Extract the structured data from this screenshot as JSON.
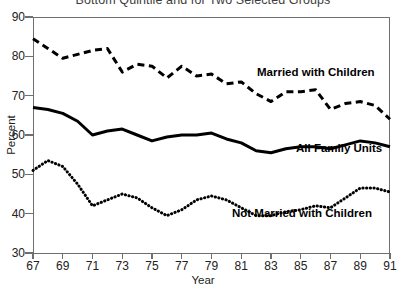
{
  "chart_data": {
    "type": "line",
    "title": "Bottom Quintile and for Two Selected Groups",
    "xlabel": "Year",
    "ylabel": "Percent",
    "xlim": [
      67,
      91
    ],
    "ylim": [
      30,
      90
    ],
    "yticks": [
      30,
      40,
      50,
      60,
      70,
      80,
      90
    ],
    "xticks": [
      67,
      69,
      71,
      73,
      75,
      77,
      79,
      81,
      83,
      85,
      87,
      89,
      91
    ],
    "grid": false,
    "legend_position": "inline-annotations",
    "x": [
      67,
      68,
      69,
      70,
      71,
      72,
      73,
      74,
      75,
      76,
      77,
      78,
      79,
      80,
      81,
      82,
      83,
      84,
      85,
      86,
      87,
      88,
      89,
      90,
      91
    ],
    "series": [
      {
        "name": "Married with Children",
        "style": "dashed",
        "color": "#000000",
        "values": [
          84.5,
          82.0,
          79.5,
          80.5,
          81.5,
          82.0,
          76.0,
          78.0,
          77.5,
          74.5,
          77.5,
          75.0,
          75.5,
          73.0,
          73.5,
          70.5,
          68.5,
          71.0,
          71.0,
          71.5,
          66.5,
          68.0,
          68.5,
          67.5,
          64.0
        ]
      },
      {
        "name": "All Family Units",
        "style": "solid",
        "color": "#000000",
        "values": [
          67.0,
          66.5,
          65.5,
          63.5,
          60.0,
          61.0,
          61.5,
          60.0,
          58.5,
          59.5,
          60.0,
          60.0,
          60.5,
          59.0,
          58.0,
          56.0,
          55.5,
          56.5,
          57.0,
          57.0,
          56.5,
          57.5,
          58.5,
          58.0,
          57.0
        ]
      },
      {
        "name": "Not Married with Children",
        "style": "dotted",
        "color": "#000000",
        "values": [
          51.0,
          53.5,
          52.0,
          47.5,
          42.0,
          43.5,
          45.0,
          44.0,
          41.5,
          39.5,
          41.0,
          43.5,
          44.5,
          43.5,
          41.5,
          39.5,
          39.5,
          40.5,
          41.0,
          42.0,
          41.5,
          44.0,
          46.5,
          46.5,
          45.5
        ]
      }
    ],
    "annotations": [
      {
        "text": "Married with Children"
      },
      {
        "text": "All Family Units"
      },
      {
        "text": "Not Married with Children"
      }
    ]
  }
}
